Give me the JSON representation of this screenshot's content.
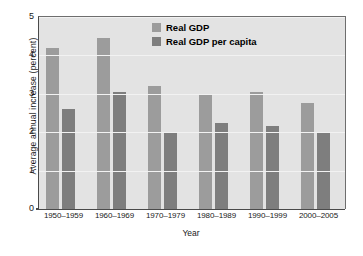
{
  "chart_data": {
    "type": "bar",
    "title": "",
    "xlabel": "Year",
    "ylabel": "Average annual increase (percent)",
    "categories": [
      "1950–1959",
      "1960–1969",
      "1970–1979",
      "1980–1989",
      "1990–1999",
      "2000–2005"
    ],
    "series": [
      {
        "name": "Real GDP",
        "color": "#9c9c9c",
        "values": [
          4.2,
          4.45,
          3.2,
          3.0,
          3.05,
          2.75
        ]
      },
      {
        "name": "Real GDP per capita",
        "color": "#7e7e7e",
        "values": [
          2.6,
          3.05,
          2.0,
          2.25,
          2.15,
          2.0
        ]
      }
    ],
    "ylim": [
      0,
      5
    ],
    "yticks": [
      0,
      1,
      2,
      3,
      4,
      5
    ],
    "ytick_labels": [
      "0",
      "1",
      "2",
      "3",
      "4",
      "5"
    ],
    "grid": true,
    "legend_position": "top-center",
    "plot_background": "#d2d2d2",
    "group_background": "#e3e3e3",
    "gridline_color": "#f2f2f2",
    "axis_color": "#4a4a4a"
  }
}
